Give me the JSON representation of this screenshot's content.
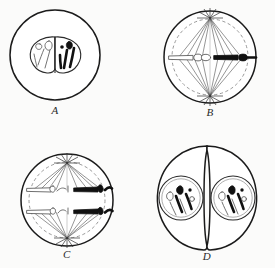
{
  "figure": {
    "background_color": "#fbfbfa",
    "ink_color": "#1b1b1b",
    "dark_chromosome_color": "#111111",
    "light_chromosome_color": "#ffffff",
    "light_chromosome_outline": "#555555",
    "dashed_envelope_color": "#8d8d8d",
    "spindle_color": "#3f3f3f"
  },
  "panels": [
    {
      "id": "A",
      "label": "A",
      "stage_name": "prophase",
      "description": "Round cell with a single bilobed nucleus; pale outlined chromosomes in the left lobe and dark filled chromosomes in the right lobe.",
      "cell": {
        "cx": 55,
        "cy": 55,
        "r": 45,
        "shape": "circle"
      },
      "nucleus": {
        "cx": 55,
        "cy": 55,
        "rx": 26,
        "ry": 18,
        "lobes": 2
      },
      "chromosome_counts": {
        "light": 4,
        "dark": 4
      },
      "has_spindle": false,
      "has_dashed_envelope": false,
      "has_asters": false,
      "daughter_cells": 1
    },
    {
      "id": "B",
      "label": "B",
      "stage_name": "metaphase",
      "description": "Spindle with two asters at top and bottom poles; dashed nuclear envelope remnant; chromosomes lined up across the equator, pale on the left, dark on the right.",
      "cell": {
        "cx": 210,
        "cy": 57,
        "r": 46,
        "shape": "circle"
      },
      "dashed_envelope": {
        "cx": 210,
        "cy": 57,
        "r": 38
      },
      "poles": [
        {
          "x": 210,
          "y": 17
        },
        {
          "x": 210,
          "y": 97
        }
      ],
      "equator_y": 58,
      "chromosome_counts": {
        "light": 3,
        "dark": 3
      },
      "has_spindle": true,
      "has_dashed_envelope": true,
      "has_asters": true,
      "daughter_cells": 1
    },
    {
      "id": "C",
      "label": "C",
      "stage_name": "anaphase",
      "description": "Spindle with asters at both poles; two ranks of chromosomes pulled apart, pale outlined group on the left and dark filled group on the right.",
      "cell": {
        "cx": 67,
        "cy": 200,
        "r": 46,
        "shape": "circle"
      },
      "dashed_envelope": {
        "cx": 67,
        "cy": 200,
        "r": 38
      },
      "poles": [
        {
          "x": 67,
          "y": 162
        },
        {
          "x": 67,
          "y": 240
        }
      ],
      "chromosome_rows": [
        190,
        212
      ],
      "chromosome_counts": {
        "light": 6,
        "dark": 6
      },
      "has_spindle": true,
      "has_dashed_envelope": true,
      "has_asters": true,
      "daughter_cells": 1
    },
    {
      "id": "D",
      "label": "D",
      "stage_name": "telophase",
      "description": "Two daughter cells separated by a cleavage furrow; each contains a round nucleus holding a mixture of dark filled and pale outlined chromosomes.",
      "cell": {
        "cx": 207,
        "cy": 198,
        "r": 52,
        "shape": "two-lobed"
      },
      "furrow_x": 207,
      "nuclei": [
        {
          "cx": 181,
          "cy": 198,
          "r": 22
        },
        {
          "cx": 233,
          "cy": 198,
          "r": 22
        }
      ],
      "chromosome_counts": {
        "light": 8,
        "dark": 6
      },
      "has_spindle": false,
      "has_dashed_envelope": false,
      "has_asters": false,
      "daughter_cells": 2
    }
  ],
  "labels": {
    "a": "A",
    "b": "B",
    "c": "C",
    "d": "D"
  }
}
